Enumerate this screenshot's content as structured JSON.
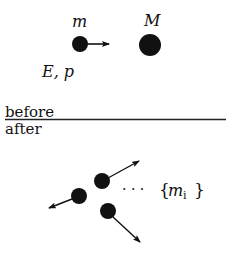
{
  "diagram": {
    "before": {
      "section_label": "before",
      "projectile": {
        "mass_label": "m",
        "energy_momentum_label": "E, p",
        "center": [
          80,
          44
        ],
        "radius": 8,
        "arrow_to": [
          109,
          44
        ]
      },
      "target": {
        "mass_label": "M",
        "center": [
          150,
          45
        ],
        "radius": 11
      }
    },
    "after": {
      "section_label": "after",
      "products": [
        {
          "center": [
            102,
            181
          ],
          "radius": 8,
          "arrow_to": [
            139,
            161
          ]
        },
        {
          "center": [
            79,
            196
          ],
          "radius": 8,
          "arrow_to": [
            49,
            208
          ]
        },
        {
          "center": [
            108,
            211
          ],
          "radius": 8,
          "arrow_to": [
            140,
            242
          ]
        }
      ],
      "ellipsis": "· · ·",
      "products_label_open": "{",
      "products_label_var": "m",
      "products_label_sub": "i",
      "products_label_close": "}"
    },
    "divider": {
      "y": 119,
      "x1": 5,
      "x2": 226
    },
    "colors": {
      "ink": "#111111",
      "background": "#ffffff"
    }
  }
}
